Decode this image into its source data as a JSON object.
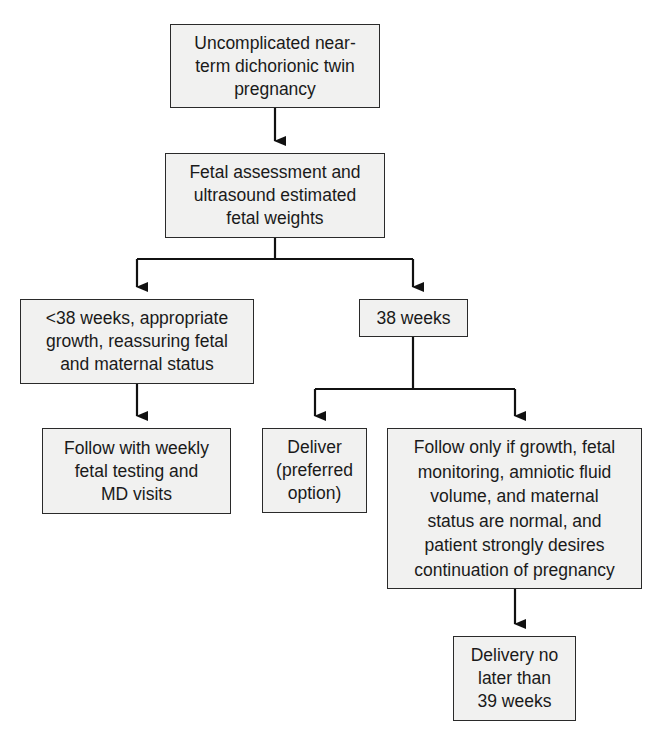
{
  "diagram": {
    "type": "flowchart",
    "nodes": [
      {
        "id": "start",
        "label": "Uncomplicated near-\nterm dichorionic twin\npregnancy"
      },
      {
        "id": "assess",
        "label": "Fetal assessment and\nultrasound estimated\nfetal weights"
      },
      {
        "id": "lt38",
        "label": "<38 weeks, appropriate\ngrowth, reassuring fetal\nand maternal status"
      },
      {
        "id": "w38",
        "label": "38 weeks"
      },
      {
        "id": "follow_weekly",
        "label": "Follow with weekly\nfetal testing and\nMD visits"
      },
      {
        "id": "deliver",
        "label": "Deliver\n(preferred\noption)"
      },
      {
        "id": "follow_only",
        "label": "Follow only if growth, fetal\nmonitoring, amniotic fluid\nvolume, and maternal\nstatus are normal, and\npatient strongly desires\ncontinuation of pregnancy"
      },
      {
        "id": "deliver39",
        "label": "Delivery no\nlater than\n39 weeks"
      }
    ],
    "edges": [
      {
        "from": "start",
        "to": "assess"
      },
      {
        "from": "assess",
        "to": "lt38"
      },
      {
        "from": "assess",
        "to": "w38"
      },
      {
        "from": "lt38",
        "to": "follow_weekly"
      },
      {
        "from": "w38",
        "to": "deliver"
      },
      {
        "from": "w38",
        "to": "follow_only"
      },
      {
        "from": "follow_only",
        "to": "deliver39"
      }
    ],
    "colors": {
      "box_fill": "#f1f1f0",
      "box_border": "#2a2a2a",
      "line": "#111111",
      "text": "#1a1a1a"
    }
  }
}
